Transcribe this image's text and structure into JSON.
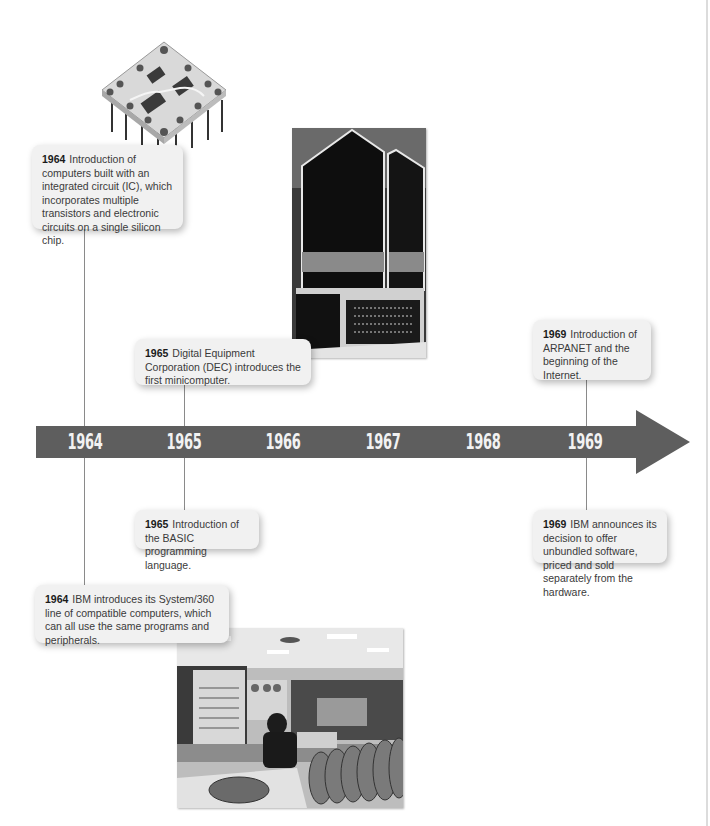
{
  "timeline": {
    "years": [
      "1964",
      "1965",
      "1966",
      "1967",
      "1968",
      "1969"
    ],
    "arrow_color": "#5e5e5e",
    "label_color": "#f2f2f2"
  },
  "events": [
    {
      "year": "1964",
      "text": "Introduction of computers built with an integrated circuit (IC), which incorporates multiple transistors and electronic circuits on a single silicon chip."
    },
    {
      "year": "1965",
      "text": "Digital Equipment Corporation (DEC) introduces the first minicomputer."
    },
    {
      "year": "1969",
      "text": "Introduction of ARPANET and the beginning of the Internet."
    },
    {
      "year": "1965",
      "text": "Introduction of the BASIC programming language."
    },
    {
      "year": "1969",
      "text": "IBM announces its decision to offer unbundled software, priced and sold separately from the hardware."
    },
    {
      "year": "1964",
      "text": "IBM introduces its System/360 line of compatible computers, which can all use the same programs and peripherals."
    }
  ],
  "images": [
    {
      "name": "integrated-circuit-chip"
    },
    {
      "name": "dec-minicomputer-photo"
    },
    {
      "name": "ibm-system-360-photo"
    }
  ]
}
